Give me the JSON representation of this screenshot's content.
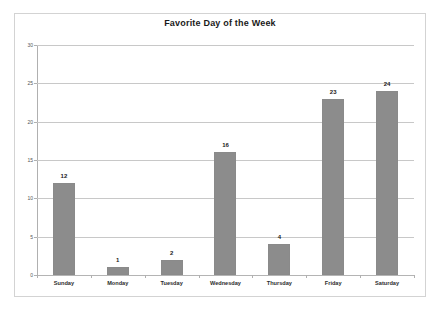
{
  "chart_data": {
    "type": "bar",
    "title": "Favorite Day of the Week",
    "xlabel": "",
    "ylabel": "",
    "categories": [
      "Sunday",
      "Monday",
      "Tuesday",
      "Wednesday",
      "Thursday",
      "Friday",
      "Saturday"
    ],
    "values": [
      12,
      1,
      2,
      16,
      4,
      23,
      24
    ],
    "data_labels": [
      "12",
      "1",
      "2",
      "16",
      "4",
      "23",
      "24"
    ],
    "ylim": [
      0,
      30
    ],
    "y_ticks": [
      0,
      5,
      10,
      15,
      20,
      25,
      30
    ],
    "y_tick_labels": [
      "0",
      "5",
      "10",
      "15",
      "20",
      "25",
      "30"
    ],
    "grid": true,
    "grid_axis": "y",
    "legend": false,
    "legend_position": "none",
    "bar_color": "#8c8c8c",
    "grid_color": "#c8c8c8",
    "axis_color": "#b0b0b0",
    "frame_color": "#d3d3d3",
    "background_color": "#ffffff",
    "title_color": "#1a1a1a",
    "label_color": "#2b2b2b"
  }
}
